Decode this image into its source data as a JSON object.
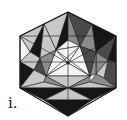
{
  "figure": {
    "label": "i.",
    "center": [
      68,
      63
    ],
    "outline": [
      [
        68,
        12
      ],
      [
        116,
        36
      ],
      [
        116,
        88
      ],
      [
        68,
        116
      ],
      [
        20,
        88
      ],
      [
        20,
        36
      ]
    ],
    "colors": {
      "black": "#161616",
      "dark": "#4a4a4a",
      "mid": "#8c8c8c",
      "light": "#c8c8c8",
      "white": "#f4f4f4",
      "stroke": "#1a1a1a"
    },
    "faces": [
      {
        "pts": [
          [
            68,
            12
          ],
          [
            44,
            24
          ],
          [
            56,
            50
          ]
        ],
        "fill": "light"
      },
      {
        "pts": [
          [
            44,
            24
          ],
          [
            20,
            36
          ],
          [
            30,
            52
          ]
        ],
        "fill": "light"
      },
      {
        "pts": [
          [
            44,
            24
          ],
          [
            30,
            52
          ],
          [
            40,
            58
          ]
        ],
        "fill": "black"
      },
      {
        "pts": [
          [
            44,
            24
          ],
          [
            56,
            50
          ],
          [
            40,
            58
          ]
        ],
        "fill": "light"
      },
      {
        "pts": [
          [
            68,
            12
          ],
          [
            56,
            50
          ],
          [
            68,
            40
          ]
        ],
        "fill": "black"
      },
      {
        "pts": [
          [
            20,
            36
          ],
          [
            30,
            52
          ],
          [
            20,
            62
          ]
        ],
        "fill": "white"
      },
      {
        "pts": [
          [
            20,
            62
          ],
          [
            30,
            52
          ],
          [
            40,
            58
          ],
          [
            34,
            70
          ]
        ],
        "fill": "light"
      },
      {
        "pts": [
          [
            20,
            62
          ],
          [
            34,
            70
          ],
          [
            20,
            88
          ]
        ],
        "fill": "black"
      },
      {
        "pts": [
          [
            34,
            70
          ],
          [
            40,
            58
          ],
          [
            46,
            76
          ]
        ],
        "fill": "dark"
      },
      {
        "pts": [
          [
            20,
            88
          ],
          [
            34,
            70
          ],
          [
            46,
            76
          ],
          [
            44,
            82
          ]
        ],
        "fill": "light"
      },
      {
        "pts": [
          [
            68,
            12
          ],
          [
            68,
            40
          ],
          [
            80,
            46
          ]
        ],
        "fill": "mid"
      },
      {
        "pts": [
          [
            68,
            12
          ],
          [
            80,
            46
          ],
          [
            92,
            24
          ]
        ],
        "fill": "dark"
      },
      {
        "pts": [
          [
            92,
            24
          ],
          [
            80,
            46
          ],
          [
            96,
            52
          ]
        ],
        "fill": "mid"
      },
      {
        "pts": [
          [
            92,
            24
          ],
          [
            116,
            36
          ],
          [
            96,
            52
          ]
        ],
        "fill": "black"
      },
      {
        "pts": [
          [
            116,
            36
          ],
          [
            96,
            52
          ],
          [
            108,
            60
          ]
        ],
        "fill": "dark"
      },
      {
        "pts": [
          [
            116,
            36
          ],
          [
            108,
            60
          ],
          [
            116,
            62
          ]
        ],
        "fill": "black"
      },
      {
        "pts": [
          [
            96,
            52
          ],
          [
            108,
            60
          ],
          [
            96,
            74
          ]
        ],
        "fill": "mid"
      },
      {
        "pts": [
          [
            108,
            60
          ],
          [
            116,
            62
          ],
          [
            116,
            88
          ],
          [
            104,
            78
          ]
        ],
        "fill": "dark"
      },
      {
        "pts": [
          [
            96,
            74
          ],
          [
            108,
            60
          ],
          [
            104,
            78
          ]
        ],
        "fill": "light"
      },
      {
        "pts": [
          [
            90,
            82
          ],
          [
            96,
            74
          ],
          [
            104,
            78
          ],
          [
            116,
            88
          ]
        ],
        "fill": "mid"
      },
      {
        "pts": [
          [
            68,
            40
          ],
          [
            56,
            50
          ],
          [
            80,
            46
          ]
        ],
        "fill": "white"
      },
      {
        "pts": [
          [
            56,
            50
          ],
          [
            46,
            76
          ],
          [
            68,
            63
          ]
        ],
        "fill": "white"
      },
      {
        "pts": [
          [
            56,
            50
          ],
          [
            80,
            46
          ],
          [
            68,
            63
          ]
        ],
        "fill": "white"
      },
      {
        "pts": [
          [
            80,
            46
          ],
          [
            90,
            76
          ],
          [
            68,
            63
          ]
        ],
        "fill": "white"
      },
      {
        "pts": [
          [
            46,
            76
          ],
          [
            90,
            76
          ],
          [
            68,
            63
          ]
        ],
        "fill": "white"
      },
      {
        "pts": [
          [
            56,
            50
          ],
          [
            40,
            58
          ],
          [
            46,
            76
          ]
        ],
        "fill": "mid"
      },
      {
        "pts": [
          [
            80,
            46
          ],
          [
            96,
            52
          ],
          [
            90,
            76
          ]
        ],
        "fill": "dark"
      },
      {
        "pts": [
          [
            96,
            52
          ],
          [
            96,
            74
          ],
          [
            90,
            76
          ]
        ],
        "fill": "mid"
      },
      {
        "pts": [
          [
            46,
            76
          ],
          [
            68,
            88
          ],
          [
            44,
            82
          ]
        ],
        "fill": "mid"
      },
      {
        "pts": [
          [
            46,
            76
          ],
          [
            90,
            76
          ],
          [
            68,
            88
          ]
        ],
        "fill": "light"
      },
      {
        "pts": [
          [
            90,
            76
          ],
          [
            90,
            82
          ],
          [
            68,
            88
          ]
        ],
        "fill": "mid"
      },
      {
        "pts": [
          [
            20,
            88
          ],
          [
            44,
            82
          ],
          [
            68,
            88
          ]
        ],
        "fill": "light"
      },
      {
        "pts": [
          [
            68,
            88
          ],
          [
            90,
            82
          ],
          [
            116,
            88
          ]
        ],
        "fill": "light"
      },
      {
        "pts": [
          [
            20,
            88
          ],
          [
            68,
            88
          ],
          [
            44,
            100
          ]
        ],
        "fill": "black"
      },
      {
        "pts": [
          [
            68,
            88
          ],
          [
            116,
            88
          ],
          [
            92,
            100
          ]
        ],
        "fill": "black"
      },
      {
        "pts": [
          [
            44,
            100
          ],
          [
            68,
            88
          ],
          [
            92,
            100
          ]
        ],
        "fill": "light"
      },
      {
        "pts": [
          [
            44,
            100
          ],
          [
            92,
            100
          ],
          [
            68,
            116
          ]
        ],
        "fill": "black"
      }
    ],
    "lines": [
      [
        [
          20,
          36
        ],
        [
          116,
          36
        ]
      ],
      [
        [
          20,
          62
        ],
        [
          116,
          62
        ]
      ],
      [
        [
          68,
          40
        ],
        [
          68,
          88
        ]
      ],
      [
        [
          56,
          50
        ],
        [
          90,
          76
        ]
      ],
      [
        [
          80,
          46
        ],
        [
          46,
          76
        ]
      ],
      [
        [
          20,
          36
        ],
        [
          68,
          63
        ]
      ],
      [
        [
          116,
          36
        ],
        [
          68,
          63
        ]
      ],
      [
        [
          68,
          88
        ],
        [
          68,
          116
        ]
      ]
    ],
    "center_dot_radius": 1.6
  }
}
